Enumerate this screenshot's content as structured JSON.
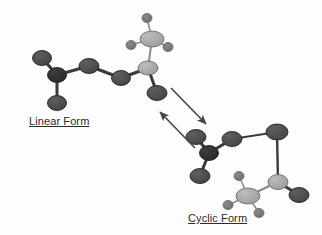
{
  "figure": {
    "background_color": "#fdfdfd",
    "canvas": {
      "width": 322,
      "height": 235
    }
  },
  "labels": {
    "linear_form": "Linear Form",
    "cyclic_form": "Cyclic Form"
  },
  "colors": {
    "atom_dark": "#4a4a4a",
    "atom_darkest": "#303030",
    "atom_light": "#a8a8a8",
    "atom_small": "#777777",
    "bond_dark": "#3a3a3a",
    "bond_light": "#8c8c8c",
    "arrow": "#444444",
    "text": "#2b2b2b"
  },
  "linear_form": {
    "name": "Linear Form",
    "atoms": [
      {
        "id": "L1",
        "cx": 42,
        "cy": 58,
        "rx": 9.5,
        "ry": 7.5,
        "shade": "dark"
      },
      {
        "id": "L2",
        "cx": 57,
        "cy": 75,
        "rx": 9.5,
        "ry": 7.5,
        "shade": "darkest"
      },
      {
        "id": "L3",
        "cx": 57,
        "cy": 103,
        "rx": 9.5,
        "ry": 7.5,
        "shade": "dark"
      },
      {
        "id": "L4",
        "cx": 89,
        "cy": 66,
        "rx": 10,
        "ry": 7.5,
        "shade": "dark"
      },
      {
        "id": "L5",
        "cx": 121,
        "cy": 78,
        "rx": 9.5,
        "ry": 7.5,
        "shade": "dark"
      },
      {
        "id": "L6",
        "cx": 148,
        "cy": 68,
        "rx": 10,
        "ry": 7,
        "shade": "light"
      },
      {
        "id": "L7",
        "cx": 157,
        "cy": 93,
        "rx": 10,
        "ry": 7.5,
        "shade": "dark"
      },
      {
        "id": "L8",
        "cx": 152,
        "cy": 39,
        "rx": 12,
        "ry": 8,
        "shade": "light"
      },
      {
        "id": "L9",
        "cx": 147,
        "cy": 18,
        "rx": 5,
        "ry": 4.5,
        "shade": "small"
      },
      {
        "id": "L10",
        "cx": 131,
        "cy": 45,
        "rx": 5,
        "ry": 4.5,
        "shade": "small"
      },
      {
        "id": "L11",
        "cx": 168,
        "cy": 47,
        "rx": 5,
        "ry": 4.5,
        "shade": "small"
      }
    ],
    "bonds": [
      {
        "from": "L1",
        "to": "L2",
        "tone": "dark",
        "width": 3
      },
      {
        "from": "L2",
        "to": "L3",
        "tone": "dark",
        "width": 3
      },
      {
        "from": "L2",
        "to": "L4",
        "tone": "dark",
        "width": 3
      },
      {
        "from": "L4",
        "to": "L5",
        "tone": "dark",
        "width": 3
      },
      {
        "from": "L5",
        "to": "L6",
        "tone": "dark",
        "width": 3
      },
      {
        "from": "L6",
        "to": "L7",
        "tone": "dark",
        "width": 3
      },
      {
        "from": "L6",
        "to": "L8",
        "tone": "light",
        "width": 2
      },
      {
        "from": "L8",
        "to": "L9",
        "tone": "light",
        "width": 1.6
      },
      {
        "from": "L8",
        "to": "L10",
        "tone": "light",
        "width": 1.6
      },
      {
        "from": "L8",
        "to": "L11",
        "tone": "light",
        "width": 1.6
      }
    ]
  },
  "cyclic_form": {
    "name": "Cyclic Form",
    "atoms": [
      {
        "id": "C1",
        "cx": 196,
        "cy": 137,
        "rx": 10,
        "ry": 7.5,
        "shade": "dark"
      },
      {
        "id": "C2",
        "cx": 209,
        "cy": 153,
        "rx": 9.5,
        "ry": 7.5,
        "shade": "darkest"
      },
      {
        "id": "C3",
        "cx": 200,
        "cy": 176,
        "rx": 10,
        "ry": 7.5,
        "shade": "dark"
      },
      {
        "id": "C4",
        "cx": 232,
        "cy": 139,
        "rx": 10,
        "ry": 7.5,
        "shade": "dark"
      },
      {
        "id": "C5",
        "cx": 277,
        "cy": 132,
        "rx": 11,
        "ry": 8,
        "shade": "dark"
      },
      {
        "id": "C6",
        "cx": 278,
        "cy": 182,
        "rx": 10,
        "ry": 7.5,
        "shade": "light"
      },
      {
        "id": "C7",
        "cx": 299,
        "cy": 195,
        "rx": 10,
        "ry": 7.5,
        "shade": "dark"
      },
      {
        "id": "C8",
        "cx": 248,
        "cy": 196,
        "rx": 12,
        "ry": 8,
        "shade": "light"
      },
      {
        "id": "C9",
        "cx": 239,
        "cy": 176,
        "rx": 5,
        "ry": 4.5,
        "shade": "small"
      },
      {
        "id": "C10",
        "cx": 228,
        "cy": 205,
        "rx": 5,
        "ry": 4.5,
        "shade": "small"
      },
      {
        "id": "C11",
        "cx": 259,
        "cy": 213,
        "rx": 5,
        "ry": 4.5,
        "shade": "small"
      }
    ],
    "bonds": [
      {
        "from": "C1",
        "to": "C2",
        "tone": "dark",
        "width": 3
      },
      {
        "from": "C2",
        "to": "C3",
        "tone": "dark",
        "width": 3
      },
      {
        "from": "C2",
        "to": "C4",
        "tone": "dark",
        "width": 3
      },
      {
        "from": "C4",
        "to": "C5",
        "tone": "dark",
        "width": 1.8
      },
      {
        "from": "C5",
        "to": "C6",
        "tone": "dark",
        "width": 2.4
      },
      {
        "from": "C6",
        "to": "C7",
        "tone": "dark",
        "width": 3
      },
      {
        "from": "C6",
        "to": "C8",
        "tone": "light",
        "width": 2.4
      },
      {
        "from": "C8",
        "to": "C9",
        "tone": "light",
        "width": 1.6
      },
      {
        "from": "C8",
        "to": "C10",
        "tone": "light",
        "width": 1.6
      },
      {
        "from": "C8",
        "to": "C11",
        "tone": "light",
        "width": 1.6
      }
    ]
  },
  "equilibrium_arrows": [
    {
      "id": "arrow-forward",
      "direction": "linear-to-cyclic",
      "x1": 171,
      "y1": 88,
      "x2": 206,
      "y2": 124
    },
    {
      "id": "arrow-reverse",
      "direction": "cyclic-to-linear",
      "x1": 195,
      "y1": 148,
      "x2": 160,
      "y2": 112
    }
  ]
}
